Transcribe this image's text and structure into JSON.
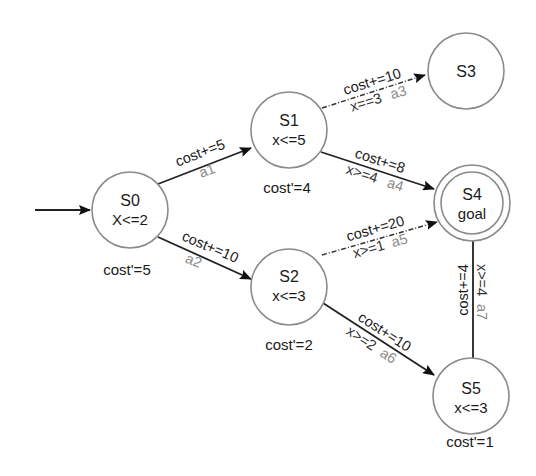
{
  "diagram": {
    "type": "priced-timed-automaton",
    "initial_state": "S0",
    "nodes": [
      {
        "id": "S0",
        "name": "S0",
        "invariant": "X<=2",
        "cost_rate": "cost'=5",
        "goal": false
      },
      {
        "id": "S1",
        "name": "S1",
        "invariant": "x<=5",
        "cost_rate": "cost'=4",
        "goal": false
      },
      {
        "id": "S2",
        "name": "S2",
        "invariant": "x<=3",
        "cost_rate": "cost'=2",
        "goal": false
      },
      {
        "id": "S3",
        "name": "S3",
        "invariant": "",
        "cost_rate": "",
        "goal": false
      },
      {
        "id": "S4",
        "name": "S4",
        "invariant": "goal",
        "cost_rate": "",
        "goal": true
      },
      {
        "id": "S5",
        "name": "S5",
        "invariant": "x<=3",
        "cost_rate": "cost'=1",
        "goal": false
      }
    ],
    "edges": [
      {
        "from": "S0",
        "to": "S1",
        "update": "cost+=5",
        "guard": "",
        "action": "a1",
        "style": "solid"
      },
      {
        "from": "S0",
        "to": "S2",
        "update": "cost+=10",
        "guard": "",
        "action": "a2",
        "style": "solid"
      },
      {
        "from": "S1",
        "to": "S3",
        "update": "cost+=10",
        "guard": "x==3",
        "action": "a3",
        "style": "dashed"
      },
      {
        "from": "S1",
        "to": "S4",
        "update": "cost+=8",
        "guard": "x>=4",
        "action": "a4",
        "style": "solid"
      },
      {
        "from": "S2",
        "to": "S4",
        "update": "cost+=20",
        "guard": "x>=1",
        "action": "a5",
        "style": "dashed"
      },
      {
        "from": "S2",
        "to": "S5",
        "update": "cost+=10",
        "guard": "x>=2",
        "action": "a6",
        "style": "solid"
      },
      {
        "from": "S5",
        "to": "S4",
        "update": "cost+=4",
        "guard": "x>=4",
        "action": "a7",
        "style": "solid"
      }
    ]
  },
  "colors": {
    "background": "#ffffff",
    "node_stroke": "#8a8a8a",
    "edge": "#222222",
    "text": "#1a1a1a",
    "action_text": "#8a8a8a"
  }
}
